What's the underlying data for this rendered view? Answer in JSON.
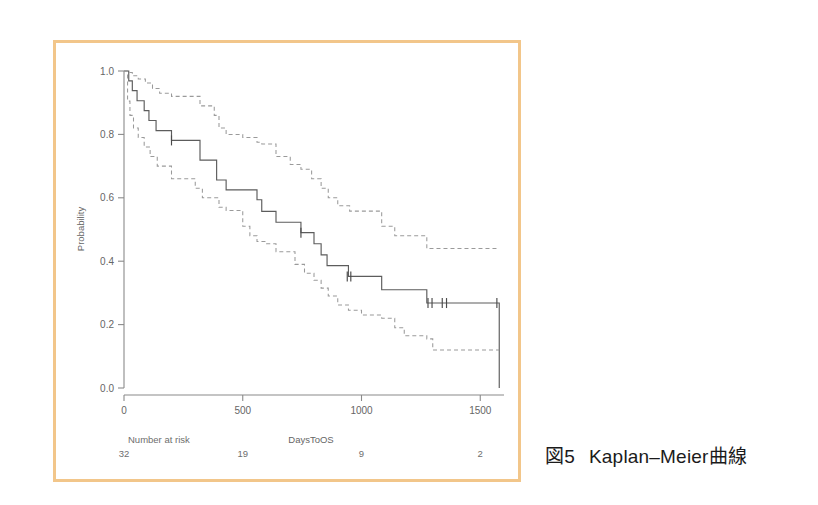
{
  "figure": {
    "caption_number": "図5",
    "caption_title": "Kaplan–Meier曲線",
    "border_color": "#f2c68a",
    "background_color": "#ffffff"
  },
  "chart_data": {
    "type": "line",
    "title": "",
    "xlabel": "DaysToOS",
    "ylabel": "Probability",
    "xlim": [
      0,
      1600
    ],
    "ylim": [
      0,
      1.0
    ],
    "xticks": [
      0,
      500,
      1000,
      1500
    ],
    "xticklabels": [
      "0",
      "500",
      "1000",
      "1500"
    ],
    "yticks": [
      0.0,
      0.2,
      0.4,
      0.6,
      0.8,
      1.0
    ],
    "yticklabels": [
      "0.0",
      "0.2",
      "0.4",
      "0.6",
      "0.8",
      "1.0"
    ],
    "grid": false,
    "legend": "none",
    "series": [
      {
        "name": "Kaplan-Meier estimate",
        "style": "solid",
        "color": "#5c5c5c",
        "steps": [
          [
            0,
            1.0
          ],
          [
            20,
            0.969
          ],
          [
            35,
            0.938
          ],
          [
            55,
            0.906
          ],
          [
            85,
            0.875
          ],
          [
            105,
            0.844
          ],
          [
            135,
            0.812
          ],
          [
            200,
            0.781
          ],
          [
            320,
            0.719
          ],
          [
            390,
            0.656
          ],
          [
            430,
            0.625
          ],
          [
            560,
            0.594
          ],
          [
            580,
            0.557
          ],
          [
            640,
            0.523
          ],
          [
            745,
            0.49
          ],
          [
            800,
            0.455
          ],
          [
            830,
            0.42
          ],
          [
            855,
            0.386
          ],
          [
            945,
            0.352
          ],
          [
            1085,
            0.31
          ],
          [
            1275,
            0.268
          ],
          [
            1580,
            0.268
          ],
          [
            1580,
            0.0
          ]
        ]
      },
      {
        "name": "Upper 95% confidence limit",
        "style": "dashed",
        "color": "#9a9a9a",
        "steps": [
          [
            0,
            1.0
          ],
          [
            20,
            0.995
          ],
          [
            35,
            0.985
          ],
          [
            60,
            0.975
          ],
          [
            90,
            0.962
          ],
          [
            120,
            0.945
          ],
          [
            150,
            0.93
          ],
          [
            200,
            0.92
          ],
          [
            320,
            0.89
          ],
          [
            380,
            0.86
          ],
          [
            400,
            0.82
          ],
          [
            430,
            0.8
          ],
          [
            500,
            0.79
          ],
          [
            560,
            0.775
          ],
          [
            580,
            0.77
          ],
          [
            640,
            0.73
          ],
          [
            700,
            0.705
          ],
          [
            745,
            0.69
          ],
          [
            790,
            0.66
          ],
          [
            830,
            0.63
          ],
          [
            860,
            0.6
          ],
          [
            900,
            0.575
          ],
          [
            950,
            0.558
          ],
          [
            1085,
            0.51
          ],
          [
            1140,
            0.48
          ],
          [
            1275,
            0.44
          ],
          [
            1580,
            0.44
          ]
        ]
      },
      {
        "name": "Lower 95% confidence limit",
        "style": "dashed",
        "color": "#9a9a9a",
        "steps": [
          [
            0,
            1.0
          ],
          [
            15,
            0.905
          ],
          [
            25,
            0.86
          ],
          [
            40,
            0.82
          ],
          [
            60,
            0.79
          ],
          [
            85,
            0.76
          ],
          [
            110,
            0.73
          ],
          [
            140,
            0.7
          ],
          [
            200,
            0.66
          ],
          [
            300,
            0.63
          ],
          [
            330,
            0.6
          ],
          [
            400,
            0.57
          ],
          [
            430,
            0.56
          ],
          [
            500,
            0.51
          ],
          [
            530,
            0.48
          ],
          [
            560,
            0.462
          ],
          [
            600,
            0.455
          ],
          [
            640,
            0.43
          ],
          [
            720,
            0.39
          ],
          [
            760,
            0.362
          ],
          [
            800,
            0.34
          ],
          [
            830,
            0.315
          ],
          [
            860,
            0.29
          ],
          [
            900,
            0.262
          ],
          [
            945,
            0.245
          ],
          [
            1000,
            0.23
          ],
          [
            1085,
            0.22
          ],
          [
            1140,
            0.19
          ],
          [
            1180,
            0.165
          ],
          [
            1275,
            0.155
          ],
          [
            1300,
            0.12
          ],
          [
            1580,
            0.12
          ]
        ]
      }
    ],
    "censor_marks": [
      {
        "x": 200,
        "y": 0.781
      },
      {
        "x": 745,
        "y": 0.49
      },
      {
        "x": 940,
        "y": 0.352
      },
      {
        "x": 955,
        "y": 0.352
      },
      {
        "x": 1280,
        "y": 0.268
      },
      {
        "x": 1297,
        "y": 0.268
      },
      {
        "x": 1340,
        "y": 0.268
      },
      {
        "x": 1358,
        "y": 0.268
      },
      {
        "x": 1570,
        "y": 0.268
      }
    ],
    "risk_table": {
      "label": "Number at risk",
      "times": [
        0,
        500,
        1000,
        1500
      ],
      "counts": [
        "32",
        "19",
        "9",
        "2"
      ]
    }
  }
}
